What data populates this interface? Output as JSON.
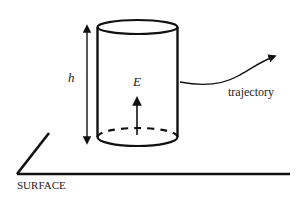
{
  "diagram": {
    "labels": {
      "height": "h",
      "field": "E",
      "trajectory": "trajectory",
      "surface": "SURFACE"
    },
    "elements": [
      {
        "id": "cylinder",
        "description": "Gaussian cylinder standing above surface"
      },
      {
        "id": "height-arrow",
        "description": "double-headed arrow indicating height h"
      },
      {
        "id": "field-arrow",
        "description": "upward arrow indicating field E inside cylinder"
      },
      {
        "id": "trajectory-arrow",
        "description": "curved arrow leaving cylinder labeled trajectory"
      },
      {
        "id": "surface",
        "description": "ground surface drawn in perspective"
      }
    ],
    "colors": {
      "stroke": "#111111",
      "background": "#ffffff"
    }
  }
}
